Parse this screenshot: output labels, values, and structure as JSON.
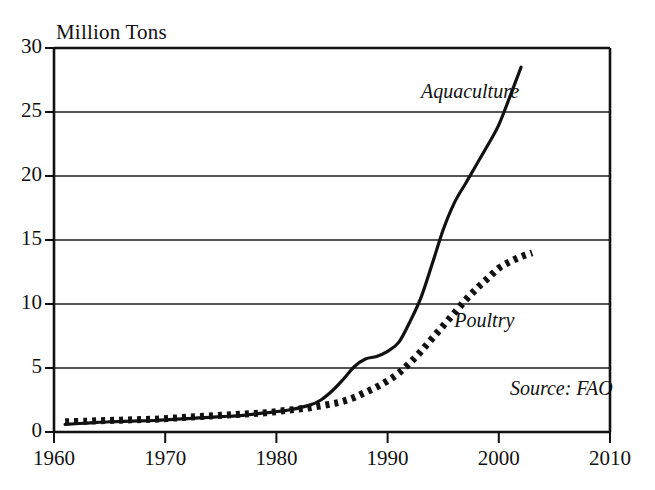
{
  "chart_data": {
    "type": "line",
    "title": "",
    "ylabel": "Million Tons",
    "xlabel": "",
    "xlim": [
      1960,
      2010
    ],
    "ylim": [
      0,
      30
    ],
    "grid": true,
    "legend_position": "inline-annotations",
    "annotations": [
      {
        "name": "aquaculture-label",
        "text": "Aquaculture",
        "x": 1993,
        "y": 26.5
      },
      {
        "name": "poultry-label",
        "text": "Poultry",
        "x": 1996,
        "y": 8.6
      },
      {
        "name": "source-note",
        "text": "Source: FAO",
        "x": 2001,
        "y": 3.3
      }
    ],
    "ytick_labels": [
      "0",
      "5",
      "10",
      "15",
      "20",
      "25",
      "30"
    ],
    "ytick_values": [
      0,
      5,
      10,
      15,
      20,
      25,
      30
    ],
    "xtick_labels": [
      "1960",
      "1970",
      "1980",
      "1990",
      "2000",
      "2010"
    ],
    "xtick_values": [
      1960,
      1970,
      1980,
      1990,
      2000,
      2010
    ],
    "series": [
      {
        "name": "Aquaculture",
        "style": "solid",
        "color": "#111111",
        "x": [
          1961,
          1963,
          1965,
          1967,
          1969,
          1971,
          1973,
          1975,
          1977,
          1979,
          1981,
          1983,
          1984,
          1985,
          1986,
          1987,
          1988,
          1989,
          1990,
          1991,
          1992,
          1993,
          1994,
          1995,
          1996,
          1997,
          1998,
          1999,
          2000,
          2001,
          2002
        ],
        "y": [
          0.6,
          0.7,
          0.8,
          0.85,
          0.9,
          1.0,
          1.1,
          1.2,
          1.3,
          1.5,
          1.7,
          2.1,
          2.5,
          3.2,
          4.1,
          5.1,
          5.7,
          5.9,
          6.3,
          7.0,
          8.6,
          10.5,
          13.1,
          15.8,
          17.9,
          19.4,
          20.9,
          22.4,
          24.0,
          26.2,
          28.5
        ]
      },
      {
        "name": "Poultry",
        "style": "dotted",
        "color": "#111111",
        "x": [
          1961,
          1963,
          1965,
          1967,
          1969,
          1971,
          1973,
          1975,
          1977,
          1979,
          1981,
          1983,
          1985,
          1986,
          1987,
          1988,
          1989,
          1990,
          1991,
          1992,
          1993,
          1994,
          1995,
          1996,
          1997,
          1998,
          1999,
          2000,
          2001,
          2002,
          2003
        ],
        "y": [
          0.8,
          0.85,
          0.9,
          0.95,
          1.0,
          1.1,
          1.2,
          1.3,
          1.4,
          1.5,
          1.7,
          1.9,
          2.2,
          2.4,
          2.7,
          3.1,
          3.5,
          4.0,
          4.6,
          5.4,
          6.3,
          7.3,
          8.3,
          9.3,
          10.3,
          11.2,
          12.0,
          12.8,
          13.3,
          13.7,
          14.0
        ]
      }
    ]
  },
  "geometry": {
    "plot_left": 54,
    "plot_right": 610,
    "plot_top": 48,
    "plot_bottom": 432
  }
}
